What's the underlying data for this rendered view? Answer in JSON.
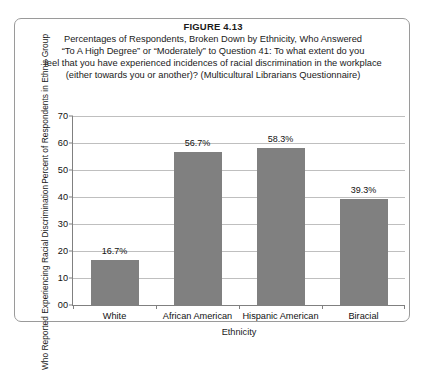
{
  "figure": {
    "number_label": "FIGURE 4.13",
    "caption_lines": [
      "Percentages of Respondents, Broken Down by Ethnicity, Who Answered",
      "“To A High Degree” or “Moderately” to Question 41: To what extent do you",
      "feel that you have experienced incidences of racial discrimination in the workplace",
      "(either towards you or another)? (Multicultural Librarians Questionnaire)"
    ],
    "border_color": "#9a9a9a",
    "background_color": "#ffffff"
  },
  "chart_data": {
    "type": "bar",
    "title": "FIGURE 4.13",
    "subtitle": "Percentages of Respondents, Broken Down by Ethnicity, Who Answered “To A High Degree” or “Moderately” to Question 41: To what extent do you feel that you have experienced incidences of racial discrimination in the workplace (either towards you or another)? (Multicultural Librarians Questionnaire)",
    "categories": [
      "White",
      "African American",
      "Hispanic American",
      "Biracial"
    ],
    "values": [
      16.7,
      56.7,
      58.3,
      39.3
    ],
    "data_labels": [
      "16.7%",
      "58.3%",
      "56.7%",
      "39.3%"
    ],
    "xlabel": "Ethnicity",
    "ylabel": "Percent of Respondents in Ethnic Group Who Reported Experiencing Racial Discrimination",
    "ylabel_line1": "Percent of Respondents in Ethnic Group",
    "ylabel_line2": "Who Reported Experiencing Racial Discrimination",
    "ylim": [
      0,
      70
    ],
    "ytick_values": [
      0,
      10,
      20,
      30,
      40,
      50,
      60,
      70
    ],
    "ytick_labels": [
      "00",
      "10",
      "20",
      "30",
      "40",
      "50",
      "60",
      "70"
    ],
    "grid": true,
    "grid_axis": "y",
    "legend": false,
    "bar_color": "#808080",
    "gridline_color": "#bfbfbf",
    "axis_color": "#808080",
    "bars": [
      {
        "category": "White",
        "value": 16.7,
        "label": "16.7%"
      },
      {
        "category": "African American",
        "value": 56.7,
        "label": "56.7%"
      },
      {
        "category": "Hispanic American",
        "value": 58.3,
        "label": "58.3%"
      },
      {
        "category": "Biracial",
        "value": 39.3,
        "label": "39.3%"
      }
    ]
  }
}
